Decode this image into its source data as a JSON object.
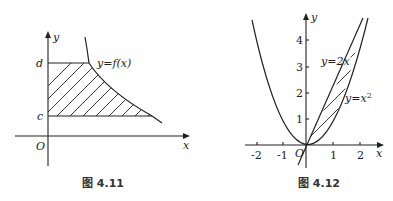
{
  "figures": [
    {
      "id": "fig-4-11",
      "caption": "图 4.11",
      "axis_labels": {
        "x": "x",
        "y": "y",
        "origin": "O"
      },
      "y_marks": {
        "upper": "d",
        "lower": "c"
      },
      "curve_label": "y=f(x)",
      "region": "shaded region bounded by y-axis, y=c, y=d and curve y=f(x)"
    },
    {
      "id": "fig-4-12",
      "caption": "图 4.12",
      "axis_labels": {
        "x": "x",
        "y": "y",
        "origin": "O"
      },
      "x_ticks": [
        "-2",
        "-1",
        "1",
        "2"
      ],
      "y_ticks": [
        "1",
        "2",
        "3",
        "4"
      ],
      "curves": [
        {
          "label": "y=2x",
          "type": "line"
        },
        {
          "label": "y=x²",
          "type": "parabola",
          "label_base": "y=x",
          "label_sup": "2"
        }
      ],
      "region": "shaded region between y=2x and y=x² for 0 ≤ x ≤ 2"
    }
  ],
  "colors": {
    "ink": "#222222",
    "background": "#ffffff"
  }
}
